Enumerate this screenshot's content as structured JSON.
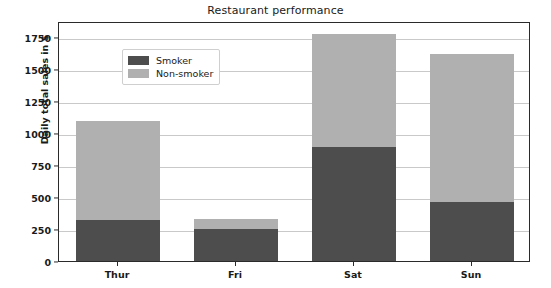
{
  "chart_data": {
    "type": "bar",
    "title": "Restaurant performance",
    "xlabel": "",
    "ylabel": "Daily total sales in $",
    "categories": [
      "Thur",
      "Fri",
      "Sat",
      "Sun"
    ],
    "series": [
      {
        "name": "Smoker",
        "color": "#4d4d4d",
        "values": [
          320,
          250,
          890,
          460
        ]
      },
      {
        "name": "Non-smoker",
        "color": "#b0b0b0",
        "values": [
          775,
          75,
          885,
          1160
        ]
      }
    ],
    "totals": [
      1095,
      325,
      1775,
      1620
    ],
    "stacked": true,
    "ylim": [
      0,
      1875
    ],
    "yticks": [
      0,
      250,
      500,
      750,
      1000,
      1250,
      1500,
      1750
    ],
    "ytick_labels": [
      "0",
      "250",
      "500",
      "750",
      "1000",
      "1250",
      "1500",
      "1750"
    ],
    "grid": "horizontal",
    "legend_position": "upper left",
    "legend_entries": [
      "Smoker",
      "Non-smoker"
    ]
  }
}
